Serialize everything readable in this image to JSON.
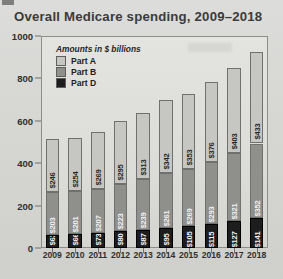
{
  "chart_data": {
    "type": "bar",
    "subtype": "stacked-bar",
    "title": "Overall Medicare spending, 2009–2018",
    "xlabel": "",
    "ylabel": "",
    "units_note": "Amounts in $ billions",
    "ylim": [
      0,
      1000
    ],
    "yticks": [
      0,
      200,
      400,
      600,
      800,
      1000
    ],
    "ytick_labels": [
      "0",
      "200",
      "400",
      "600",
      "800",
      "1000"
    ],
    "grid": false,
    "legend_position": "top-left-inside",
    "categories": [
      "2009",
      "2010",
      "2011",
      "2012",
      "2013",
      "2014",
      "2015",
      "2016",
      "2017",
      "2018"
    ],
    "series": [
      {
        "name": "Part D",
        "order": 0,
        "color": "#1d1d1d",
        "values": [
          63,
          66,
          73,
          80,
          87,
          95,
          105,
          115,
          127,
          141
        ],
        "labels": [
          "$63",
          "$66",
          "$73",
          "$80",
          "$87",
          "$95",
          "$105",
          "$115",
          "$127",
          "$141"
        ]
      },
      {
        "name": "Part B",
        "order": 1,
        "color": "#8f8f8c",
        "values": [
          203,
          201,
          207,
          223,
          239,
          261,
          269,
          293,
          321,
          352
        ],
        "labels": [
          "$203",
          "$201",
          "$207",
          "$223",
          "$239",
          "$261",
          "$269",
          "$293",
          "$321",
          "$352"
        ]
      },
      {
        "name": "Part A",
        "order": 2,
        "color": "#c6c6c2",
        "values": [
          246,
          254,
          269,
          295,
          313,
          342,
          353,
          376,
          403,
          433
        ],
        "labels": [
          "$246",
          "$254",
          "$269",
          "$295",
          "$313",
          "$342",
          "$353",
          "$376",
          "$403",
          "$433"
        ]
      }
    ],
    "totals": [
      512,
      521,
      549,
      598,
      639,
      698,
      727,
      784,
      851,
      926
    ]
  },
  "legend": {
    "title": "Amounts in $ billions",
    "entries": [
      {
        "label": "Part A",
        "swatch_class": "sw-a"
      },
      {
        "label": "Part B",
        "swatch_class": "sw-b"
      },
      {
        "label": "Part D",
        "swatch_class": "sw-d"
      }
    ]
  }
}
